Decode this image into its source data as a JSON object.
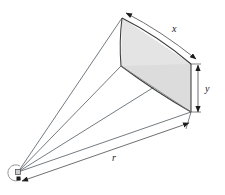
{
  "figure": {
    "type": "geometry-diagram",
    "background_color": "#ffffff",
    "line_color": "#555f66",
    "outline_color": "#3c3c3c",
    "fill_color": "#e3e3e3",
    "fill_color_lower": "#d9d9d9",
    "text_color": "#1a1a1a"
  },
  "labels": {
    "x": "x",
    "y": "y",
    "r": "r"
  },
  "label_positions": {
    "x": {
      "tx": 172,
      "ty": 32
    },
    "y": {
      "tx": 206,
      "ty": 92
    },
    "r": {
      "tx": 113,
      "ty": 160
    }
  },
  "geometry": {
    "apex": {
      "x": 18,
      "y": 172
    },
    "patch_corners": {
      "top_left": {
        "x": 122,
        "y": 18
      },
      "top_right": {
        "x": 191,
        "y": 64
      },
      "bottom_right": {
        "x": 191,
        "y": 112
      },
      "bottom_left": {
        "x": 121,
        "y": 66
      }
    },
    "dimension_lines": {
      "x_line": {
        "x1": 127,
        "y1": 14,
        "x2": 196,
        "y2": 60
      },
      "y_line": {
        "x1": 198,
        "y1": 66,
        "x2": 198,
        "y2": 113
      },
      "r_line": {
        "x1": 22,
        "y1": 180,
        "x2": 190,
        "y2": 122
      }
    },
    "apex_marker": {
      "arc_radius": 8,
      "square_size": 5
    }
  },
  "elements": {
    "patch_upper_label": "shaded-quadrilateral-upper",
    "patch_lower_label": "shaded-quadrilateral-lower",
    "ray_count": 4
  }
}
